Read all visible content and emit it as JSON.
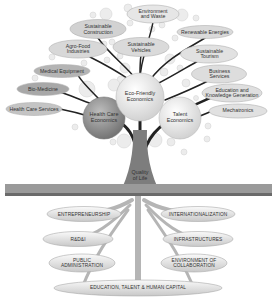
{
  "diagram": {
    "type": "tree",
    "trunk_label": "Quality\nof Life",
    "main_branches": [
      {
        "id": "health",
        "label": "Health Care\nEconomics",
        "x": 104,
        "y": 118,
        "r": 21,
        "fill": "#8d8d8d"
      },
      {
        "id": "eco",
        "label": "Eco-Friendly\nEconomics",
        "x": 140,
        "y": 97,
        "r": 24,
        "fill": "#e6e6e6"
      },
      {
        "id": "talent",
        "label": "Talent\nEconomics",
        "x": 180,
        "y": 118,
        "r": 21,
        "fill": "#d9d9d9"
      }
    ],
    "leaves": [
      {
        "label": "Environment\nand Waste",
        "x": 153,
        "y": 14,
        "w": 52,
        "h": 18,
        "fill": "#e4e4e4"
      },
      {
        "label": "Sustainable\nConstruction",
        "x": 98,
        "y": 29,
        "w": 56,
        "h": 19,
        "fill": "#cfcfcf"
      },
      {
        "label": "Renewable Energies",
        "x": 205,
        "y": 32,
        "w": 56,
        "h": 13,
        "fill": "#d9d9d9"
      },
      {
        "label": "Agro-Food\nIndustries",
        "x": 78,
        "y": 49,
        "w": 58,
        "h": 18,
        "fill": "#d6d6d6"
      },
      {
        "label": "Sustainable\nVehicles",
        "x": 141,
        "y": 47,
        "w": 56,
        "h": 19,
        "fill": "#d9d9d9"
      },
      {
        "label": "Sustainable\nTourism",
        "x": 209,
        "y": 54,
        "w": 57,
        "h": 18,
        "fill": "#e0e0e0"
      },
      {
        "label": "Medical Equipment",
        "x": 62,
        "y": 71,
        "w": 56,
        "h": 13,
        "fill": "#b4b4b4"
      },
      {
        "label": "Business\nServices",
        "x": 219,
        "y": 74,
        "w": 55,
        "h": 18,
        "fill": "#dcdcdc"
      },
      {
        "label": "Bio-Medicine",
        "x": 43,
        "y": 89,
        "w": 52,
        "h": 13,
        "fill": "#a6a6a6"
      },
      {
        "label": "Education and\nKnowledge Generation",
        "x": 232,
        "y": 93,
        "w": 60,
        "h": 18,
        "fill": "#dedede"
      },
      {
        "label": "Health Care Services",
        "x": 34,
        "y": 109,
        "w": 56,
        "h": 13,
        "fill": "#c2c2c2"
      },
      {
        "label": "Mechatronics",
        "x": 238,
        "y": 111,
        "w": 58,
        "h": 14,
        "fill": "#e0e0e0"
      }
    ],
    "roots": [
      {
        "label": "ENTREPRENEURSHIP",
        "x": 84,
        "y": 214,
        "w": 74,
        "h": 15
      },
      {
        "label": "INTERNATIONALIZATION",
        "x": 198,
        "y": 214,
        "w": 74,
        "h": 15
      },
      {
        "label": "R&D&I",
        "x": 78,
        "y": 239,
        "w": 70,
        "h": 15
      },
      {
        "label": "INFRASTRUCTURES",
        "x": 198,
        "y": 239,
        "w": 70,
        "h": 15
      },
      {
        "label": "PUBLIC\nADMINISTRATION",
        "x": 82,
        "y": 263,
        "w": 66,
        "h": 18
      },
      {
        "label": "ENVIRONMENT OF\nCOLLABORATION",
        "x": 194,
        "y": 263,
        "w": 66,
        "h": 18
      },
      {
        "label": "EDUCATION, TALENT & HUMAN CAPITAL",
        "x": 138,
        "y": 288,
        "w": 168,
        "h": 16
      }
    ],
    "colors": {
      "trunk": "#7d7d7d",
      "branch": "#222222",
      "grass": "#888888",
      "root_fill": "#e2e2e2",
      "bubble": "#e9e9e9"
    }
  }
}
